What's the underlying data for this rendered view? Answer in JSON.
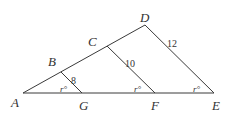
{
  "diagram": {
    "points": {
      "A": "A",
      "B": "B",
      "C": "C",
      "D": "D",
      "E": "E",
      "F": "F",
      "G": "G"
    },
    "segments": {
      "BG": "8",
      "CF": "10",
      "DE": "12"
    },
    "angles": {
      "AGB": "r°",
      "AFC": "r°",
      "AED": "r°"
    }
  }
}
